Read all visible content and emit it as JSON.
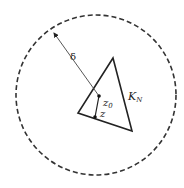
{
  "diagram": {
    "circle": {
      "cx": 96,
      "cy": 95,
      "r": 80,
      "style": "dashed",
      "color": "#333333"
    },
    "triangle": {
      "points": [
        [
          113,
          58
        ],
        [
          78,
          113
        ],
        [
          132,
          131
        ]
      ],
      "label": "K_N",
      "label_main": "K",
      "label_sub": "N",
      "color": "#222222"
    },
    "points": [
      {
        "name": "z0",
        "label_main": "z",
        "label_sub": "0",
        "x": 99,
        "y": 96
      },
      {
        "name": "z",
        "label_main": "z",
        "label_sub": "",
        "x": 95,
        "y": 117
      }
    ],
    "radius_arrow": {
      "from": [
        99,
        96
      ],
      "to": [
        53,
        32
      ],
      "label": "δ"
    },
    "segment": {
      "from": "z0",
      "to": "z"
    }
  }
}
